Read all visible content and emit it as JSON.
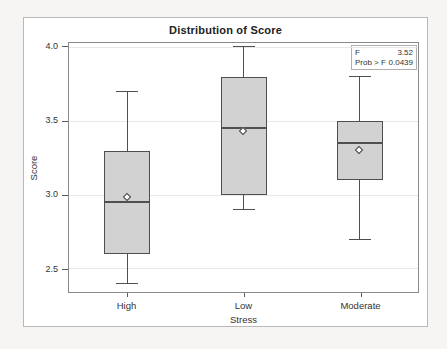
{
  "chart_data": {
    "type": "box",
    "title": "Distribution of Score",
    "xlabel": "Stress",
    "ylabel": "Score",
    "categories": [
      "High",
      "Low",
      "Moderate"
    ],
    "boxes": [
      {
        "category": "High",
        "whisker_low": 2.4,
        "q1": 2.6,
        "median": 2.95,
        "mean": 2.98,
        "q3": 3.3,
        "whisker_high": 3.7
      },
      {
        "category": "Low",
        "whisker_low": 2.9,
        "q1": 3.0,
        "median": 3.45,
        "mean": 3.43,
        "q3": 3.8,
        "whisker_high": 4.0
      },
      {
        "category": "Moderate",
        "whisker_low": 2.7,
        "q1": 3.1,
        "median": 3.35,
        "mean": 3.3,
        "q3": 3.5,
        "whisker_high": 3.8
      }
    ],
    "yticks": [
      {
        "label": "4.0",
        "value": 4.0
      },
      {
        "label": "3.5",
        "value": 3.5
      },
      {
        "label": "3.0",
        "value": 3.0
      },
      {
        "label": "2.5",
        "value": 2.5
      }
    ],
    "ylim": [
      2.34,
      4.03
    ],
    "grid": true,
    "legend": "none",
    "annotation_box": {
      "rows": [
        {
          "label": "F",
          "value": "3.52"
        },
        {
          "label": "Prob > F",
          "value": "0.0439"
        }
      ]
    }
  },
  "colors": {
    "page_bg": "#f6f5f3",
    "figure_bg": "#ffffff",
    "figure_border": "#bab8b5",
    "frame_border": "#8a8a8a",
    "gridline": "#e9e8e6",
    "box_fill": "#d2d2d2",
    "box_border": "#4f4f4f",
    "line": "#4f4f4f",
    "stats_border": "#b0b0b0",
    "text": "#222222"
  }
}
